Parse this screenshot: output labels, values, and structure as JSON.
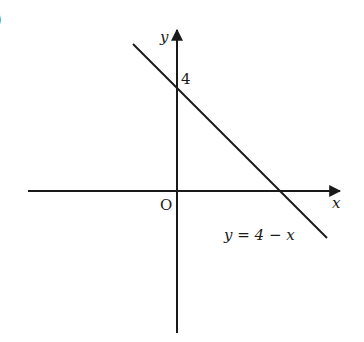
{
  "figure": {
    "part_marker": ")",
    "axes": {
      "x_label": "x",
      "y_label": "y",
      "origin_label": "O"
    },
    "y_intercept_label": "4",
    "line_label": "y = 4 − x",
    "colors": {
      "ink": "#1a1a1a",
      "background": "#ffffff"
    }
  }
}
